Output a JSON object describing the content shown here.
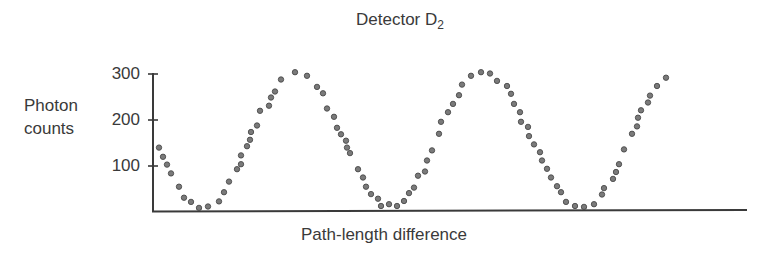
{
  "figure": {
    "title_main": "Detector D",
    "title_subscript": "2",
    "ylabel_line1": "Photon",
    "ylabel_line2": "counts",
    "xlabel": "Path-length difference"
  },
  "axes": {
    "y_ticks": [
      "300",
      "200",
      "100"
    ],
    "colors": {
      "axis": "#3a3a3a",
      "dot_fill": "#7a7a7a",
      "dot_stroke": "#4a4a4a",
      "text": "#3a3a3a"
    }
  },
  "chart_data": {
    "type": "scatter",
    "title": "Detector D2",
    "xlabel": "Path-length difference",
    "ylabel": "Photon counts",
    "x_units": "arbitrary (no x tick labels shown; x measured as relative position from y-axis)",
    "ylim": [
      0,
      300
    ],
    "y_ticks": [
      100,
      200,
      300
    ],
    "grid": false,
    "legend": null,
    "series": [
      {
        "name": "Detector D2",
        "x": [
          6,
          10,
          14,
          18,
          26,
          31,
          38,
          46,
          55,
          66,
          71,
          76,
          84,
          88,
          88,
          94,
          97,
          98,
          104,
          107,
          116,
          118,
          122,
          128,
          142,
          154,
          164,
          170,
          174,
          181,
          184,
          188,
          193,
          194,
          197,
          205,
          210,
          213,
          218,
          225,
          228,
          236,
          244,
          251,
          256,
          261,
          265,
          272,
          274,
          279,
          286,
          288,
          295,
          300,
          306,
          309,
          318,
          328,
          337,
          344,
          354,
          358,
          361,
          367,
          368,
          375,
          376,
          381,
          387,
          389,
          394,
          398,
          404,
          408,
          413,
          422,
          431,
          441,
          449,
          451,
          460,
          463,
          466,
          471,
          479,
          484,
          485,
          488,
          495,
          497,
          504,
          513
        ],
        "y": [
          140,
          120,
          103,
          84,
          55,
          31,
          22,
          9,
          12,
          23,
          43,
          66,
          93,
          104,
          123,
          143,
          157,
          174,
          188,
          220,
          231,
          249,
          262,
          288,
          304,
          296,
          272,
          258,
          225,
          207,
          183,
          169,
          155,
          140,
          128,
          93,
          75,
          55,
          39,
          29,
          13,
          17,
          13,
          24,
          41,
          53,
          79,
          88,
          112,
          134,
          170,
          196,
          217,
          235,
          254,
          277,
          296,
          304,
          301,
          285,
          274,
          257,
          235,
          217,
          196,
          185,
          165,
          147,
          130,
          112,
          94,
          75,
          56,
          43,
          22,
          13,
          11,
          17,
          38,
          52,
          72,
          87,
          104,
          136,
          170,
          186,
          205,
          221,
          238,
          253,
          274,
          292
        ]
      }
    ],
    "annotations": []
  }
}
